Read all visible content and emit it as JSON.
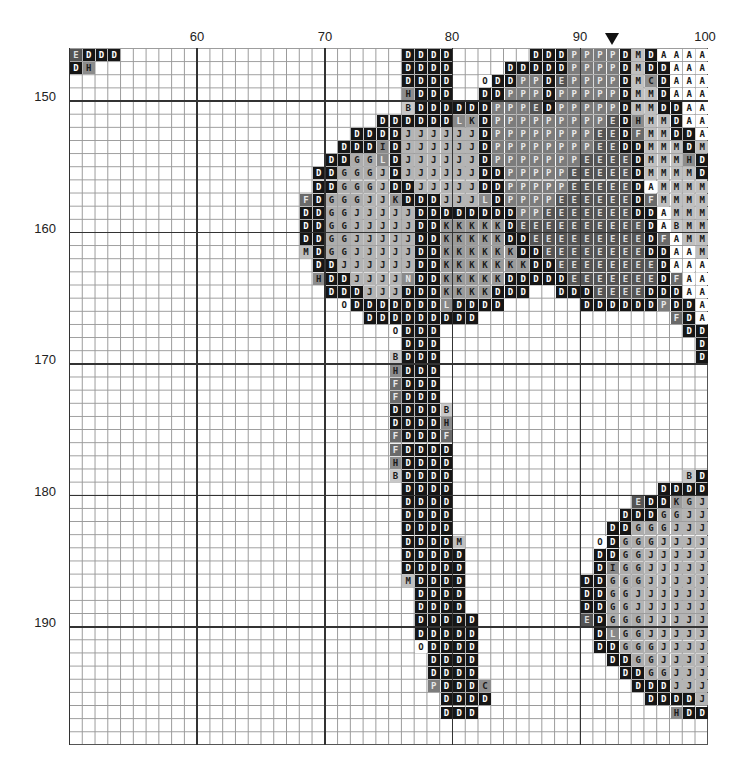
{
  "chart_title": "Cross-stitch pattern chart (partial view)",
  "chart_data": {
    "type": "table",
    "col_range": [
      51,
      100
    ],
    "row_range": [
      147,
      199
    ],
    "col_labels": [
      60,
      70,
      80,
      90,
      100
    ],
    "row_labels": [
      150,
      160,
      170,
      180,
      190
    ],
    "center_marker_col": 93,
    "symbols": {
      "D": {
        "bg": "#161616",
        "fg": "#ffffff"
      },
      "P": {
        "bg": "#7c7c7c",
        "fg": "#e8e8e8"
      },
      "E": {
        "bg": "#545454",
        "fg": "#dcdcdc"
      },
      "J": {
        "bg": "#b4b4b4",
        "fg": "#1a1a1a"
      },
      "G": {
        "bg": "#adadad",
        "fg": "#1a1a1a"
      },
      "K": {
        "bg": "#9a9a9a",
        "fg": "#1a1a1a"
      },
      "M": {
        "bg": "#c0c0c0",
        "fg": "#1a1a1a"
      },
      "A": {
        "bg": "#ffffff",
        "fg": "#1a1a1a"
      },
      "B": {
        "bg": "#c8c8c8",
        "fg": "#1a1a1a"
      },
      "H": {
        "bg": "#8c8c8c",
        "fg": "#1a1a1a"
      },
      "F": {
        "bg": "#6a6a6a",
        "fg": "#e8e8e8"
      },
      "L": {
        "bg": "#888888",
        "fg": "#e8e8e8"
      },
      "I": {
        "bg": "#8a8a8a",
        "fg": "#1a1a1a"
      },
      "O": {
        "bg": "#ffffff",
        "fg": "#1a1a1a"
      },
      "C": {
        "bg": "#8e8e8e",
        "fg": "#1a1a1a"
      },
      "N": {
        "bg": "#8a8a8a",
        "fg": "#e8e8e8"
      }
    },
    "rows": {
      "147": [
        [
          51,
          "EDDD"
        ],
        [
          77,
          "DDDD"
        ],
        [
          87,
          "DDDPPPPDMDAAAA"
        ]
      ],
      "148": [
        [
          51,
          "DH"
        ],
        [
          77,
          "DDDD"
        ],
        [
          85,
          "DDDDDPPPPDMDDAAA"
        ]
      ],
      "149": [
        [
          77,
          "DDDD"
        ],
        [
          83,
          "ODDPPDEPPPPDMCDAAA"
        ]
      ],
      "150": [
        [
          77,
          "HDDD"
        ],
        [
          83,
          "DDPPPDPPPPPDMMDAAA"
        ]
      ],
      "151": [
        [
          77,
          "BDDDDDDPPPEDPPPPPDMMDDAA"
        ]
      ],
      "152": [
        [
          75,
          "DDDDDDLKDPPPPPPPPPEDHMMDAA"
        ]
      ],
      "153": [
        [
          73,
          "DDDDJJJJJJDPPPPPPPPEEDFMMDDA"
        ]
      ],
      "154": [
        [
          72,
          "DDDIDJJJJJJDPPPPPPPPEEDDMMMDM"
        ]
      ],
      "155": [
        [
          71,
          "DDGGLDJJJJJJDPPPPPPPEEEEDMMMHD"
        ]
      ],
      "156": [
        [
          70,
          "DDGGGJDJJJJJJDDPPPPPEEEEEDMMMMD"
        ]
      ],
      "157": [
        [
          70,
          "DDGGGJDDJJJJJDDPPPPPEEEEEDAMMMM"
        ]
      ],
      "158": [
        [
          69,
          "FDGGGJJKDDDJJJLDPPPPEEEEEEDFMMMM"
        ]
      ],
      "159": [
        [
          69,
          "DDGGJJJJJDDDDDDDDPPEEEEEEEDDAMMM"
        ]
      ],
      "160": [
        [
          69,
          "DDGGJJJJJDDKKKKKDEEEEEEEEEEDABMM"
        ]
      ],
      "161": [
        [
          69,
          "DDGGJJJJJDDKKKKKDDEEEEEEEEEDFAMM"
        ]
      ],
      "162": [
        [
          69,
          "MDGGJJJJJDDKKKKKKDDEEEEEEEEDDAAM"
        ]
      ],
      "163": [
        [
          70,
          "DDJJJJJJDDKKKKKKKDDEEEEEEEEDAAA"
        ]
      ],
      "164": [
        [
          70,
          "HDDJJJJNDDKKKKKDDDDDEEEEEEEDFAA"
        ]
      ],
      "165": [
        [
          71,
          "DDDJJJDDDKKKKDDD"
        ],
        [
          89,
          "DDDEEEEDDDAA"
        ]
      ],
      "166": [
        [
          72,
          "ODDDDDDDLDDDD"
        ],
        [
          91,
          "DDDDDDPDDA"
        ]
      ],
      "167": [
        [
          74,
          "DDDDDDDDD"
        ],
        [
          98,
          "FDA"
        ]
      ],
      "168": [
        [
          76,
          "ODDD"
        ],
        [
          99,
          "DD"
        ]
      ],
      "169": [
        [
          77,
          "DDD"
        ],
        [
          100,
          "D"
        ]
      ],
      "170": [
        [
          76,
          "BDDD"
        ],
        [
          100,
          "D"
        ]
      ],
      "171": [
        [
          76,
          "HDDD"
        ]
      ],
      "172": [
        [
          76,
          "FDDD"
        ]
      ],
      "173": [
        [
          76,
          "FDDD"
        ]
      ],
      "174": [
        [
          76,
          "DDDDB"
        ]
      ],
      "175": [
        [
          76,
          "DDDDH"
        ]
      ],
      "176": [
        [
          76,
          "FDDDF"
        ]
      ],
      "177": [
        [
          76,
          "FDDDD"
        ]
      ],
      "178": [
        [
          76,
          "HDDDD"
        ]
      ],
      "179": [
        [
          76,
          "BDDDD"
        ],
        [
          99,
          "BD"
        ]
      ],
      "180": [
        [
          77,
          "DDDD"
        ],
        [
          97,
          "DDDD"
        ]
      ],
      "181": [
        [
          77,
          "DDDD"
        ],
        [
          95,
          "EDDKGJ"
        ]
      ],
      "182": [
        [
          77,
          "DDDD"
        ],
        [
          94,
          "DDDGGJJ"
        ]
      ],
      "183": [
        [
          77,
          "DDDD"
        ],
        [
          93,
          "DDGGGJJJ"
        ]
      ],
      "184": [
        [
          77,
          "DDDDM"
        ],
        [
          92,
          "ODGGGJJJJ"
        ]
      ],
      "185": [
        [
          77,
          "DDDDD"
        ],
        [
          92,
          "DDGGJJJJJ"
        ]
      ],
      "186": [
        [
          77,
          "DDDDD"
        ],
        [
          92,
          "DIGGJJJJJ"
        ]
      ],
      "187": [
        [
          77,
          "MDDDD"
        ],
        [
          91,
          "DDGGGJJJJJ"
        ]
      ],
      "188": [
        [
          78,
          "DDDD"
        ],
        [
          91,
          "DDGGJJJJJJ"
        ]
      ],
      "189": [
        [
          78,
          "DDDD"
        ],
        [
          91,
          "DDGGJJJJJJ"
        ]
      ],
      "190": [
        [
          78,
          "DDDDD"
        ],
        [
          91,
          "EDGGGJJJJJ"
        ]
      ],
      "191": [
        [
          78,
          "DDDDD"
        ],
        [
          92,
          "DLGGJJJJJ"
        ]
      ],
      "192": [
        [
          78,
          "ODDDD"
        ],
        [
          92,
          "DDGGGJJJJ"
        ]
      ],
      "193": [
        [
          79,
          "DDDD"
        ],
        [
          93,
          "DDGGJJJJ"
        ]
      ],
      "194": [
        [
          79,
          "DDDD"
        ],
        [
          94,
          "DDGGJJJ"
        ]
      ],
      "195": [
        [
          79,
          "PDDDC"
        ],
        [
          95,
          "DDDJJJ"
        ]
      ],
      "196": [
        [
          80,
          "DDDD"
        ],
        [
          96,
          "DDDDJ"
        ]
      ],
      "197": [
        [
          80,
          "DDD"
        ],
        [
          98,
          "HDD"
        ]
      ],
      "198": [],
      "199": []
    }
  },
  "axis": {
    "col_label_60": "60",
    "col_label_70": "70",
    "col_label_80": "80",
    "col_label_90": "90",
    "col_label_100": "100",
    "row_label_150": "150",
    "row_label_160": "160",
    "row_label_170": "170",
    "row_label_180": "180",
    "row_label_190": "190"
  }
}
